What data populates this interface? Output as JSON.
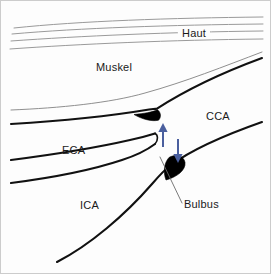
{
  "figure": {
    "background_color": "#fdfdfd",
    "border_color": "#c9c9c9",
    "width": 271,
    "height": 274
  },
  "labels": {
    "skin": "Haut",
    "muscle": "Muskel",
    "common_carotid": "CCA",
    "external_carotid": "ECA",
    "internal_carotid": "ICA",
    "bulb": "Bulbus"
  },
  "colors": {
    "vessel_wall": "#111111",
    "plaque": "#000000",
    "skin_line": "#9a9a9a",
    "fascia_line": "#8f8f8f",
    "arrow_blue": "#4a5f9e",
    "leader_line": "#6b6b6b",
    "text": "#1a1a1a"
  },
  "annotations": {
    "arrows": [
      {
        "name": "flow-arrow-up",
        "direction": "up",
        "color": "#4a5f9e",
        "x": 163,
        "y_top": 124,
        "y_bottom": 147
      },
      {
        "name": "flow-arrow-down",
        "direction": "down",
        "color": "#4a5f9e",
        "x": 178,
        "y_top": 139,
        "y_bottom": 162
      }
    ],
    "plaques": [
      {
        "name": "plaque-upper",
        "location": "distal CCA wall near bifurcation"
      },
      {
        "name": "plaque-lower",
        "location": "carotid bulb"
      }
    ],
    "leader": {
      "name": "bulbus-leader-line",
      "from_x": 160,
      "from_y": 157,
      "to_x": 182,
      "to_y": 203
    }
  },
  "structures": {
    "skin_layers_count": 4,
    "muscle_region": "between skin layers and CCA/ECA upper wall",
    "vessels": [
      "CCA",
      "ECA",
      "ICA"
    ]
  }
}
